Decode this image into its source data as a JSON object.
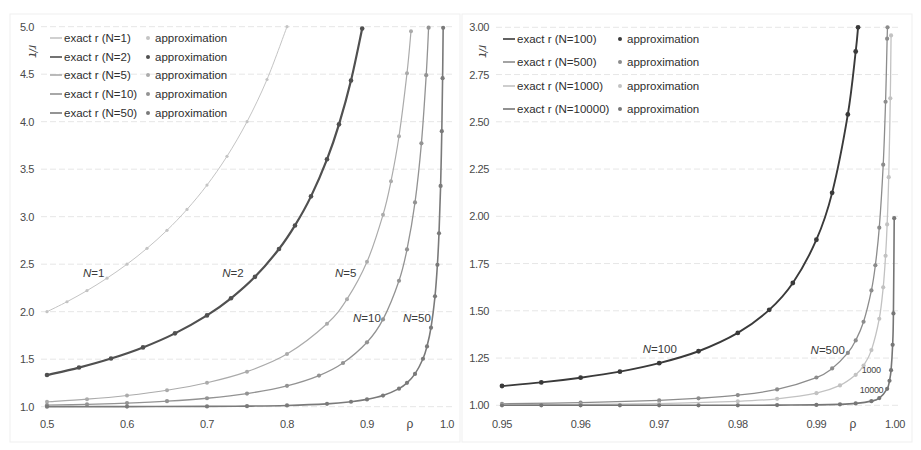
{
  "chart_data": [
    {
      "type": "line",
      "title": "",
      "xlabel": "ρ",
      "ylabel": "r/τ",
      "xlim": [
        0.5,
        1.0
      ],
      "ylim": [
        1.0,
        5.0
      ],
      "xticks": [
        0.5,
        0.6,
        0.7,
        0.8,
        0.9,
        1.0
      ],
      "xtick_labels": [
        "0.5",
        "0.6",
        "0.7",
        "0.8",
        "0.9",
        "1.0"
      ],
      "yticks": [
        1.0,
        1.5,
        2.0,
        2.5,
        3.0,
        3.5,
        4.0,
        4.5,
        5.0
      ],
      "ytick_labels": [
        "1.0",
        "1.5",
        "2.0",
        "2.5",
        "3.0",
        "3.5",
        "4.0",
        "4.5",
        "5.0"
      ],
      "grid": "horizontal",
      "legend_position": "upper left",
      "series": [
        {
          "name": "N=1",
          "exact_label": "exact r (N=1)",
          "approx_label": "approximation",
          "color": "#c4c4c4",
          "x": [
            0.5,
            0.525,
            0.55,
            0.575,
            0.6,
            0.625,
            0.65,
            0.675,
            0.7,
            0.725,
            0.75,
            0.775,
            0.8
          ],
          "y": [
            2.0,
            2.105,
            2.222,
            2.353,
            2.5,
            2.667,
            2.857,
            3.077,
            3.333,
            3.636,
            4.0,
            4.444,
            5.0
          ]
        },
        {
          "name": "N=2",
          "exact_label": "exact r (N=2)",
          "approx_label": "approximation",
          "color": "#505050",
          "x": [
            0.5,
            0.54,
            0.58,
            0.62,
            0.66,
            0.7,
            0.73,
            0.76,
            0.79,
            0.81,
            0.83,
            0.85,
            0.865,
            0.88,
            0.894
          ],
          "y": [
            1.333,
            1.412,
            1.507,
            1.624,
            1.772,
            1.961,
            2.141,
            2.367,
            2.66,
            2.908,
            3.214,
            3.604,
            3.972,
            4.433,
            4.981
          ]
        },
        {
          "name": "N=5",
          "exact_label": "exact r (N=5)",
          "approx_label": "approximation",
          "color": "#ababab",
          "x": [
            0.5,
            0.55,
            0.6,
            0.65,
            0.7,
            0.75,
            0.8,
            0.85,
            0.875,
            0.9,
            0.92,
            0.93,
            0.94,
            0.95,
            0.955
          ],
          "y": [
            1.052,
            1.079,
            1.118,
            1.173,
            1.252,
            1.369,
            1.554,
            1.873,
            2.132,
            2.525,
            3.02,
            3.374,
            3.847,
            4.511,
            4.951
          ]
        },
        {
          "name": "N=10",
          "exact_label": "exact r (N=10)",
          "approx_label": "approximation",
          "color": "#939393",
          "x": [
            0.5,
            0.55,
            0.6,
            0.65,
            0.7,
            0.75,
            0.8,
            0.84,
            0.87,
            0.9,
            0.92,
            0.94,
            0.95,
            0.96,
            0.968,
            0.974,
            0.977
          ],
          "y": [
            1.016,
            1.024,
            1.038,
            1.058,
            1.089,
            1.138,
            1.22,
            1.328,
            1.46,
            1.678,
            1.919,
            2.326,
            2.655,
            3.15,
            3.772,
            4.49,
            4.99
          ]
        },
        {
          "name": "N=50",
          "exact_label": "exact r (N=50)",
          "approx_label": "approximation",
          "color": "#7a7a7a",
          "x": [
            0.5,
            0.6,
            0.7,
            0.75,
            0.8,
            0.85,
            0.88,
            0.9,
            0.92,
            0.94,
            0.95,
            0.96,
            0.97,
            0.975,
            0.98,
            0.985,
            0.988,
            0.99,
            0.992,
            0.9935,
            0.9945,
            0.9952
          ],
          "y": [
            1.0,
            1.001,
            1.003,
            1.006,
            1.013,
            1.03,
            1.052,
            1.077,
            1.117,
            1.19,
            1.251,
            1.345,
            1.505,
            1.635,
            1.832,
            2.162,
            2.493,
            2.825,
            3.324,
            3.9,
            4.458,
            4.988
          ]
        }
      ],
      "annotations": [
        {
          "text": "N=1",
          "x": 0.545,
          "y": 2.41,
          "size": "normal"
        },
        {
          "text": "N=2",
          "x": 0.719,
          "y": 2.41,
          "size": "normal"
        },
        {
          "text": "N=5",
          "x": 0.86,
          "y": 2.41,
          "size": "normal"
        },
        {
          "text": "N=10",
          "x": 0.8825,
          "y": 1.93,
          "size": "normal"
        },
        {
          "text": "N=50",
          "x": 0.945,
          "y": 1.93,
          "size": "normal"
        }
      ]
    },
    {
      "type": "line",
      "title": "",
      "xlabel": "ρ",
      "ylabel": "r/τ",
      "xlim": [
        0.95,
        1.0
      ],
      "ylim": [
        1.0,
        3.0
      ],
      "xticks": [
        0.95,
        0.96,
        0.97,
        0.98,
        0.99,
        1.0
      ],
      "xtick_labels": [
        "0.95",
        "0.96",
        "0.97",
        "0.98",
        "0.99",
        "1.00"
      ],
      "yticks": [
        1.0,
        1.25,
        1.5,
        1.75,
        2.0,
        2.25,
        2.5,
        2.75,
        3.0
      ],
      "ytick_labels": [
        "1.00",
        "1.25",
        "1.50",
        "1.75",
        "2.00",
        "2.25",
        "2.50",
        "2.75",
        "3.00"
      ],
      "grid": "horizontal",
      "legend_position": "upper left",
      "series": [
        {
          "name": "N=100",
          "exact_label": "exact r (N=100)",
          "approx_label": "approximation",
          "color": "#3a3a3a",
          "x": [
            0.95,
            0.955,
            0.96,
            0.965,
            0.97,
            0.975,
            0.98,
            0.984,
            0.987,
            0.99,
            0.992,
            0.994,
            0.995,
            0.9953
          ],
          "y": [
            1.102,
            1.121,
            1.146,
            1.178,
            1.223,
            1.286,
            1.383,
            1.505,
            1.647,
            1.876,
            2.124,
            2.539,
            2.872,
            3.0
          ]
        },
        {
          "name": "N=500",
          "exact_label": "exact r (N=500)",
          "approx_label": "approximation",
          "color": "#8c8c8c",
          "x": [
            0.95,
            0.96,
            0.97,
            0.975,
            0.98,
            0.985,
            0.99,
            0.992,
            0.994,
            0.995,
            0.996,
            0.997,
            0.9975,
            0.998,
            0.9985,
            0.9988,
            0.999,
            0.99905
          ],
          "y": [
            1.008,
            1.014,
            1.026,
            1.037,
            1.054,
            1.084,
            1.147,
            1.195,
            1.277,
            1.343,
            1.442,
            1.608,
            1.741,
            1.94,
            2.273,
            2.606,
            2.94,
            3.0
          ]
        },
        {
          "name": "N=1000",
          "exact_label": "exact r (N=1000)",
          "approx_label": "approximation",
          "color": "#c2c2c2",
          "x": [
            0.95,
            0.96,
            0.97,
            0.98,
            0.985,
            0.99,
            0.993,
            0.995,
            0.996,
            0.997,
            0.998,
            0.9985,
            0.9988,
            0.999,
            0.9992,
            0.9994,
            0.9995
          ],
          "y": [
            1.002,
            1.004,
            1.009,
            1.021,
            1.034,
            1.064,
            1.105,
            1.161,
            1.21,
            1.292,
            1.458,
            1.624,
            1.791,
            1.957,
            2.207,
            2.624,
            2.957
          ]
        },
        {
          "name": "N=10000",
          "exact_label": "exact r (N=10000)",
          "approx_label": "approximation",
          "color": "#767676",
          "x": [
            0.95,
            0.955,
            0.96,
            0.965,
            0.97,
            0.975,
            0.98,
            0.985,
            0.99,
            0.993,
            0.995,
            0.997,
            0.998,
            0.999,
            0.9993,
            0.9995,
            0.9997,
            0.9998,
            0.9999
          ],
          "y": [
            1.0,
            1.0,
            1.0,
            1.0,
            1.0,
            1.0,
            1.0,
            1.001,
            1.002,
            1.005,
            1.01,
            1.022,
            1.038,
            1.087,
            1.13,
            1.186,
            1.32,
            1.486,
            1.99
          ]
        }
      ],
      "annotations": [
        {
          "text": "N=100",
          "x": 0.9679,
          "y": 1.296,
          "size": "normal"
        },
        {
          "text": "N=500",
          "x": 0.98926,
          "y": 1.291,
          "size": "normal"
        },
        {
          "text": "1000",
          "x": 0.99578,
          "y": 1.19,
          "size": "small"
        },
        {
          "text": "10000",
          "x": 0.99552,
          "y": 1.085,
          "size": "small"
        }
      ]
    }
  ]
}
